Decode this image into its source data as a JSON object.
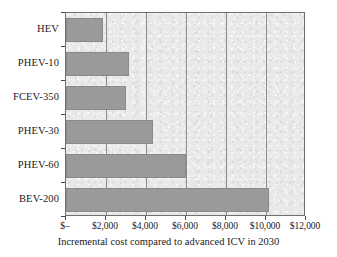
{
  "chart_data": {
    "type": "bar",
    "orientation": "horizontal",
    "title": "",
    "xlabel": "Incremental cost compared to advanced ICV in 2030",
    "ylabel": "",
    "categories": [
      "HEV",
      "PHEV-10",
      "FCEV-350",
      "PHEV-30",
      "PHEV-60",
      "BEV-200"
    ],
    "values": [
      1850,
      3150,
      3000,
      4350,
      6000,
      10150
    ],
    "xlim": [
      0,
      12000
    ],
    "xticks": [
      0,
      2000,
      4000,
      6000,
      8000,
      10000,
      12000
    ],
    "xtick_labels": [
      "$–",
      "$2,000",
      "$4,000",
      "$6,000",
      "$8,000",
      "$10,000",
      "$12,000"
    ],
    "grid": "vertical",
    "legend": "none",
    "series": [
      {
        "name": "Incremental cost",
        "values": [
          1850,
          3150,
          3000,
          4350,
          6000,
          10150
        ]
      }
    ],
    "colors": {
      "bar_fill": "#9a9a9a",
      "bar_border": "#8a8a8a",
      "plot_background": "#e9e9e9",
      "gridline": "#8d8d8d",
      "axis": "#6f6f6f",
      "text": "#1a1a1a"
    }
  }
}
